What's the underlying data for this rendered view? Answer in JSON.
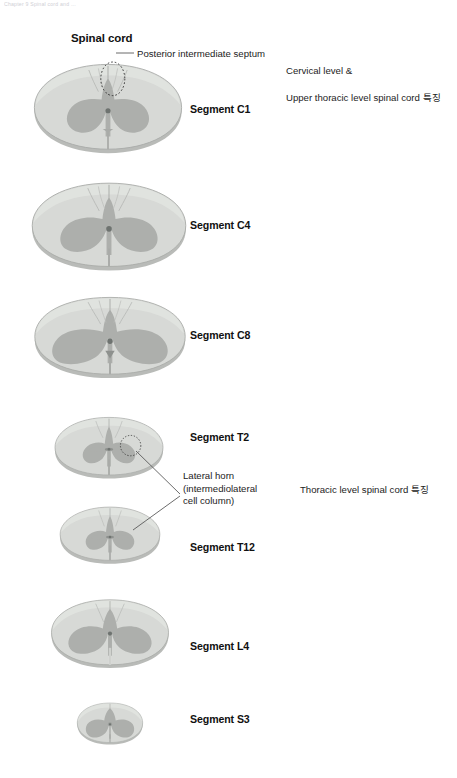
{
  "page": {
    "running_header": "Chapter 9  Spinal cord and ...",
    "width": 457,
    "height": 778,
    "background": "#ffffff"
  },
  "figure": {
    "title": "Spinal cord"
  },
  "callouts": [
    {
      "id": "posterior-intermediate-septum",
      "text": "Posterior intermediate septum"
    },
    {
      "id": "lateral-horn",
      "line1": "Lateral horn",
      "line2": "(intermediolateral",
      "line3": "cell column)"
    }
  ],
  "side_notes": [
    {
      "id": "cervical-note",
      "line1": "Cervical level &",
      "line2": "Upper thoracic level spinal cord 특징"
    },
    {
      "id": "thoracic-note",
      "line1": "Thoracic level spinal cord 특징"
    }
  ],
  "segments": [
    {
      "id": "c1",
      "label": "Segment C1"
    },
    {
      "id": "c4",
      "label": "Segment C4"
    },
    {
      "id": "c8",
      "label": "Segment C8"
    },
    {
      "id": "t2",
      "label": "Segment T2"
    },
    {
      "id": "t12",
      "label": "Segment T12"
    },
    {
      "id": "l4",
      "label": "Segment L4"
    },
    {
      "id": "s3",
      "label": "Segment S3"
    }
  ],
  "colors": {
    "white_matter": "#d5d7d4",
    "white_matter_light": "#dcdedb",
    "gray_matter": "#aeb0ad",
    "outline": "#9a9c99",
    "rim_shadow": "#b9bbb8",
    "central_canal": "#6e7370",
    "leader_line": "#5a5a5a",
    "text": "#1c1c1c",
    "header_text": "#c9c9cf"
  }
}
